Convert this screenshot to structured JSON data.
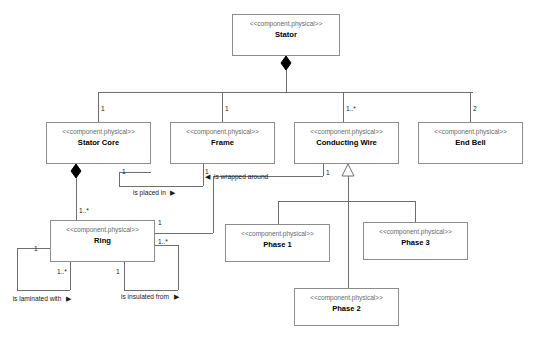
{
  "diagram": {
    "notation": "UML class/component diagram",
    "stereotype": "<<component.physical>>",
    "colors": {
      "background": "#ffffff",
      "box_border": "#8c8c8c",
      "edge_line": "#6e6e6e",
      "stereotype_text": "#6b6b6b",
      "class_name_text": "#000000",
      "marker_fill": "#000000"
    },
    "nodes": [
      {
        "id": "stator",
        "stereotype": "<<component.physical>>",
        "name": "Stator",
        "x": 232,
        "y": 14,
        "w": 108,
        "h": 42
      },
      {
        "id": "stator-core",
        "stereotype": "<<component.physical>>",
        "name": "Stator Core",
        "x": 46,
        "y": 122,
        "w": 105,
        "h": 42
      },
      {
        "id": "frame",
        "stereotype": "<<component.physical>>",
        "name": "Frame",
        "x": 170,
        "y": 122,
        "w": 105,
        "h": 42
      },
      {
        "id": "conducting-wire",
        "stereotype": "<<component.physical>>",
        "name": "Conducting Wire",
        "x": 294,
        "y": 122,
        "w": 105,
        "h": 42
      },
      {
        "id": "end-bell",
        "stereotype": "<<component.physical>>",
        "name": "End Bell",
        "x": 418,
        "y": 122,
        "w": 105,
        "h": 42
      },
      {
        "id": "ring",
        "stereotype": "<<component.physical>>",
        "name": "Ring",
        "x": 50,
        "y": 220,
        "w": 105,
        "h": 42
      },
      {
        "id": "phase-1",
        "stereotype": "<<component.physical>>",
        "name": "Phase 1",
        "x": 225,
        "y": 224,
        "w": 105,
        "h": 38
      },
      {
        "id": "phase-3",
        "stereotype": "<<component.physical>>",
        "name": "Phase 3",
        "x": 363,
        "y": 222,
        "w": 105,
        "h": 38
      },
      {
        "id": "phase-2",
        "stereotype": "<<component.physical>>",
        "name": "Phase 2",
        "x": 294,
        "y": 288,
        "w": 105,
        "h": 38
      }
    ],
    "multiplicities": [
      {
        "id": "m-stator-core",
        "value": "1",
        "x": 101,
        "y": 105
      },
      {
        "id": "m-frame",
        "value": "1",
        "x": 225,
        "y": 105
      },
      {
        "id": "m-conducting-wire",
        "value": "1..*",
        "x": 346,
        "y": 105
      },
      {
        "id": "m-end-bell",
        "value": "2",
        "x": 473,
        "y": 105
      },
      {
        "id": "m-core-placed",
        "value": "1",
        "x": 122,
        "y": 168
      },
      {
        "id": "m-frame-wrapped",
        "value": "1",
        "x": 205,
        "y": 168
      },
      {
        "id": "m-wire-wrapped",
        "value": "1",
        "x": 326,
        "y": 169
      },
      {
        "id": "m-core-ring",
        "value": "1..*",
        "x": 79,
        "y": 207
      },
      {
        "id": "m-ring-wrapped",
        "value": "1",
        "x": 158,
        "y": 219
      },
      {
        "id": "m-ring-right",
        "value": "1..*",
        "x": 158,
        "y": 238
      },
      {
        "id": "m-ring-lam-left",
        "value": "1",
        "x": 34,
        "y": 245
      },
      {
        "id": "m-ring-lam-bottom",
        "value": "1..*",
        "x": 57,
        "y": 268
      },
      {
        "id": "m-ring-ins-bottom",
        "value": "1",
        "x": 116,
        "y": 268
      }
    ],
    "edge_labels": [
      {
        "id": "is-placed-in",
        "text": "is placed in",
        "arrow": "▶",
        "x": 133,
        "y": 189,
        "layout": "inline"
      },
      {
        "id": "is-wrapped-around",
        "text": "is wrapped around",
        "arrow": "◀",
        "x": 205,
        "y": 173,
        "layout": "inline-leading-arrow"
      },
      {
        "id": "is-laminated-with",
        "text": "is laminated with",
        "arrow": "▶",
        "x": 10,
        "y": 295,
        "layout": "two-line"
      },
      {
        "id": "is-insulated-from",
        "text": "is insulated from",
        "arrow": "▶",
        "x": 118,
        "y": 293,
        "layout": "two-line"
      }
    ],
    "relationships": [
      {
        "id": "rel-stator-core",
        "from": "stator",
        "to": "stator-core",
        "type": "composition",
        "source_marker": "filled-diamond",
        "target_multiplicity": "1"
      },
      {
        "id": "rel-stator-frame",
        "from": "stator",
        "to": "frame",
        "type": "composition",
        "source_marker": "filled-diamond",
        "target_multiplicity": "1"
      },
      {
        "id": "rel-stator-wire",
        "from": "stator",
        "to": "conducting-wire",
        "type": "composition",
        "source_marker": "filled-diamond",
        "target_multiplicity": "1..*"
      },
      {
        "id": "rel-stator-bell",
        "from": "stator",
        "to": "end-bell",
        "type": "composition",
        "source_marker": "filled-diamond",
        "target_multiplicity": "2"
      },
      {
        "id": "rel-core-ring",
        "from": "stator-core",
        "to": "ring",
        "type": "composition",
        "source_marker": "filled-diamond",
        "target_multiplicity": "1..*"
      },
      {
        "id": "rel-core-frame",
        "from": "stator-core",
        "to": "frame",
        "type": "association",
        "label": "is placed in"
      },
      {
        "id": "rel-wire-ring",
        "from": "conducting-wire",
        "to": "ring",
        "type": "association",
        "label": "is wrapped around"
      },
      {
        "id": "rel-ring-lam",
        "from": "ring",
        "to": "ring",
        "type": "self-association",
        "label": "is laminated with"
      },
      {
        "id": "rel-ring-ins",
        "from": "ring",
        "to": "ring",
        "type": "self-association",
        "label": "is insulated from"
      },
      {
        "id": "rel-phase1",
        "from": "phase-1",
        "to": "conducting-wire",
        "type": "generalization",
        "target_marker": "hollow-triangle"
      },
      {
        "id": "rel-phase2",
        "from": "phase-2",
        "to": "conducting-wire",
        "type": "generalization",
        "target_marker": "hollow-triangle"
      },
      {
        "id": "rel-phase3",
        "from": "phase-3",
        "to": "conducting-wire",
        "type": "generalization",
        "target_marker": "hollow-triangle"
      }
    ]
  }
}
